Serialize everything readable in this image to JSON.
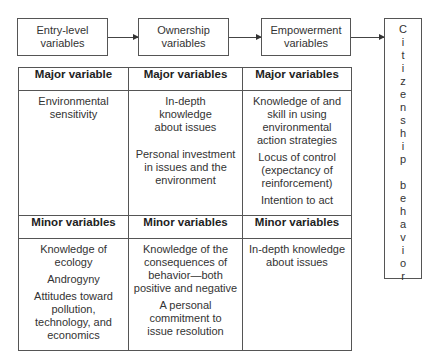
{
  "flow": {
    "boxes": [
      {
        "label": "Entry-level variables"
      },
      {
        "label": "Ownership variables"
      },
      {
        "label": "Empowerment variables"
      }
    ],
    "outcome_letters": [
      "C",
      "i",
      "t",
      "i",
      "z",
      "e",
      "n",
      "s",
      "h",
      "i",
      "p",
      " ",
      "b",
      "e",
      "h",
      "a",
      "v",
      "i",
      "o",
      "r"
    ],
    "outcome": "Citizenship behavior"
  },
  "table": {
    "major_headers": [
      "Major variable",
      "Major variables",
      "Major variables"
    ],
    "major": [
      [
        "Environmental sensitivity"
      ],
      [
        "In-depth knowledge about issues",
        "Personal investment in issues and the environment"
      ],
      [
        "Knowledge of and skill in using environmental action strategies",
        "Locus of control (expectancy of reinforcement)",
        "Intention to act"
      ]
    ],
    "minor_headers": [
      "Minor variables",
      "Minor variables",
      "Minor variables"
    ],
    "minor": [
      [
        "Knowledge of ecology",
        "Androgyny",
        "Attitudes toward pollution, technology, and economics"
      ],
      [
        "Knowledge of the consequences of behavior—both positive and negative",
        "A personal commitment to issue resolution"
      ],
      [
        "In-depth knowledge about issues"
      ]
    ]
  }
}
